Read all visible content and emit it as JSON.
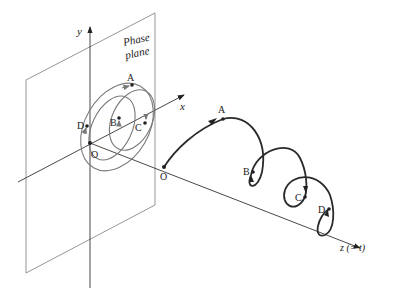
{
  "diagram": {
    "title_label": "Phase plane",
    "title_line1": "Phase",
    "title_line2": "plane",
    "axes": {
      "y_label": "y",
      "x_label": "x",
      "z_label": "z (= t)"
    },
    "phase_plane_points": {
      "origin": "O",
      "A": "A",
      "B": "B",
      "C": "C",
      "D": "D"
    },
    "trajectory_points": {
      "origin": "O",
      "A": "A",
      "B": "B",
      "C": "C",
      "D": "D"
    },
    "colors": {
      "plane_outline": "#8a8a8a",
      "axis": "#333333",
      "phase_curve": "#7a7a7a",
      "trajectory": "#2a2a2a",
      "text": "#222222"
    }
  }
}
